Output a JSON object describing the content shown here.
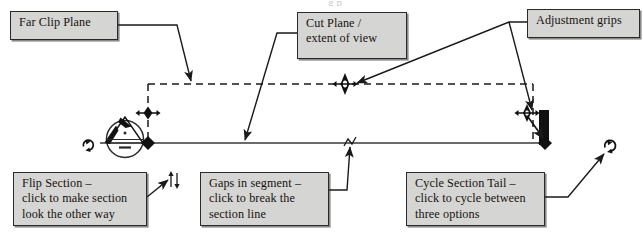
{
  "figure": {
    "type": "annotated-diagram",
    "background_color": "#ffffff",
    "ink_color": "#1a1a1a",
    "callout_fill": "#d5d5d3",
    "callout_border": "#2a2a2a",
    "partial_top_text": "g p"
  },
  "callouts": {
    "far_clip_plane": {
      "lines": [
        "Far Clip Plane"
      ],
      "text": "Far Clip Plane"
    },
    "cut_plane": {
      "lines": [
        "Cut Plane /",
        "extent of view"
      ],
      "text": "Cut Plane /\nextent of view"
    },
    "adjustment_grips": {
      "lines": [
        "Adjustment grips"
      ],
      "text": "Adjustment grips"
    },
    "flip_section": {
      "lines": [
        "Flip Section –",
        "click to make section",
        "look the other way"
      ],
      "text": "Flip Section –\nclick to make section\nlook the other way"
    },
    "gaps_in_segment": {
      "lines": [
        "Gaps in segment –",
        "click to break the",
        "section line"
      ],
      "text": "Gaps in segment –\nclick to break the\nsection line"
    },
    "cycle_section_tail": {
      "lines": [
        "Cycle Section Tail –",
        "click to cycle between",
        "three options"
      ],
      "text": "Cycle Section Tail –\nclick to cycle between\nthree options"
    }
  },
  "diagram_parts": {
    "section_line_label": "section-line",
    "far_clip_rect_label": "far-clip-plane-dashed-rectangle",
    "section_head_label": "section-head-bubble",
    "section_tail_label": "section-tail-marker",
    "gap_break_label": "gap-break-mark",
    "grips": [
      {
        "name": "grip-head-left-mid",
        "x": 148,
        "y": 113
      },
      {
        "name": "grip-head-right",
        "x": 148,
        "y": 143
      },
      {
        "name": "grip-top-center",
        "x": 345,
        "y": 84
      },
      {
        "name": "grip-tail-mid",
        "x": 527,
        "y": 113
      },
      {
        "name": "grip-tail-bottom",
        "x": 545,
        "y": 143
      }
    ],
    "rotate_icons": [
      {
        "name": "rotate-icon-left",
        "x": 88,
        "y": 145
      },
      {
        "name": "rotate-icon-right",
        "x": 610,
        "y": 146
      }
    ],
    "flip_icon": {
      "name": "flip-arrows-icon",
      "x": 174,
      "y": 180
    }
  }
}
